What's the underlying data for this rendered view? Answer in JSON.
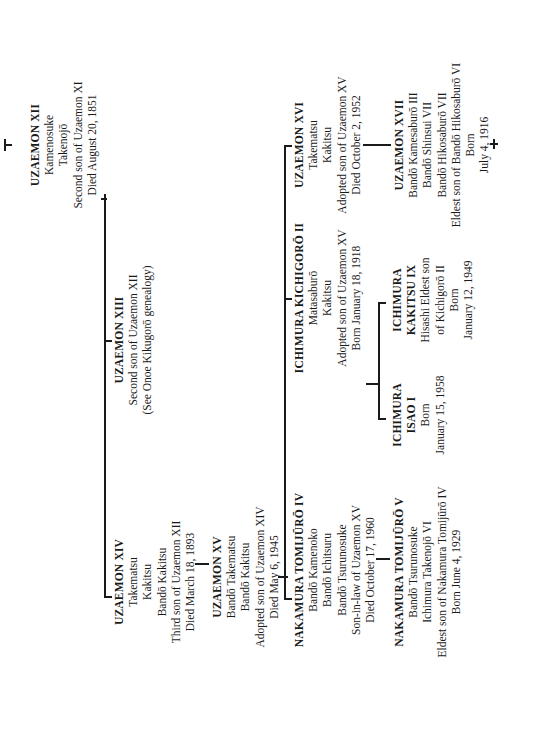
{
  "document": {
    "type": "genealogy-chart",
    "orientation": "rotated-90-ccw"
  },
  "persons": {
    "uzaemon_xii": {
      "name": "UZAEMON XII",
      "lines": [
        "Kamenosuke",
        "Takenojō",
        "Second son of Uzaemon XI",
        "Died August 20, 1851"
      ]
    },
    "uzaemon_xiii": {
      "name": "UZAEMON XIII",
      "lines": [
        "Second son of Uzaemon XII",
        "(See Onoe Kikugorō genealogy)"
      ]
    },
    "uzaemon_xiv": {
      "name": "UZAEMON XIV",
      "lines": [
        "Takematsu",
        "Kakitsu",
        "Bandō Kakitsu",
        "Third son of Uzaemon XII",
        "Died March 18, 1893"
      ]
    },
    "uzaemon_xv": {
      "name": "UZAEMON XV",
      "lines": [
        "Bandō Takematsu",
        "Bandō Kakitsu",
        "Adopted son of Uzaemon XIV",
        "Died May 6, 1945"
      ]
    },
    "uzaemon_xvi": {
      "name": "UZAEMON XVI",
      "lines": [
        "Takematsu",
        "Kakitsu",
        "Adopted son of Uzaemon XV",
        "Died October 2, 1952"
      ]
    },
    "uzaemon_xvii": {
      "name": "UZAEMON XVII",
      "lines": [
        "Bandō Kamesaburō III",
        "Bandō Shinsui VII",
        "Bandō Hikosaburō VII",
        "Eldest son of Bandō Hikosaburō VI",
        "Born",
        "July 4, 1916"
      ]
    },
    "kichigoro_ii": {
      "name": "ICHIMURA KICHIGORŌ II",
      "lines": [
        "Matasaburō",
        "Kakitsu",
        "Adopted son of Uzaemon XV",
        "Born January 18, 1918"
      ]
    },
    "kakitsu_ix": {
      "name": "ICHIMURA",
      "name2": "KAKITSU IX",
      "lines": [
        "Hisashi Eldest son",
        "of Kichigorō II",
        "Born",
        "January 12, 1949"
      ]
    },
    "isao_i": {
      "name": "ICHIMURA",
      "name2": "ISAO I",
      "lines": [
        "Born",
        "January 15, 1958"
      ]
    },
    "tomijuro_iv": {
      "name": "NAKAMURA TOMIJŪRŌ IV",
      "lines": [
        "Bandō Kamenoko",
        "Bandō Ichitsuru",
        "Bandō Tsurunosuke",
        "Son-in-law of Uzaemon XV",
        "Died October 17, 1960"
      ]
    },
    "tomijuro_v": {
      "name": "NAKAMURA TOMIJŪRŌ V",
      "lines": [
        "Bandō Tsurunosuke",
        "Ichimura Takenojō VI",
        "Eldest son of Nakamura Tomijūrō IV",
        "Born June 4, 1929"
      ]
    }
  }
}
